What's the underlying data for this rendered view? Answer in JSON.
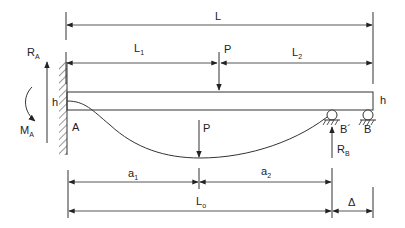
{
  "diagram": {
    "type": "beam-deflection",
    "labels": {
      "L": "L",
      "L1": "L",
      "L1_sub": "1",
      "L2": "L",
      "L2_sub": "2",
      "P_top": "P",
      "P_bottom": "P",
      "RA": "R",
      "RA_sub": "A",
      "MA": "M",
      "MA_sub": "A",
      "h_left": "h",
      "h_right": "h",
      "A": "A",
      "B_prime": "B´",
      "B": "B",
      "RB": "R",
      "RB_sub": "B",
      "a1": "a",
      "a1_sub": "1",
      "a2": "a",
      "a2_sub": "2",
      "L0": "L",
      "L0_sub": "o",
      "delta": "Δ"
    },
    "colors": {
      "line": "#333333",
      "background": "#ffffff"
    }
  }
}
